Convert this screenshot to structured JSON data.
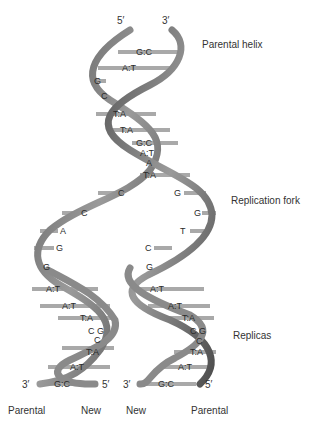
{
  "diagram": {
    "colors": {
      "ribbon": "#7a7a7a",
      "ribbon_dark": "#4a4a4a",
      "ribbon_light": "#b8b8b8",
      "bar": "#a8a8a8",
      "text": "#2a2a2a"
    }
  },
  "labels": {
    "parental_helix": "Parental helix",
    "replication_fork": "Replication fork",
    "replicas": "Replicas"
  },
  "strand_ends": {
    "top_5": "5′",
    "top_3": "3′",
    "left_3": "3′",
    "left_5": "5′",
    "right_3": "3′",
    "right_5": "5′"
  },
  "bottom_labels": {
    "left_parental": "Parental",
    "left_new": "New",
    "right_new": "New",
    "right_parental": "Parental"
  },
  "parental_helix_pairs": [
    "G:C",
    "A:T",
    "G",
    "C",
    "T:A",
    "T:A",
    "G:C",
    "A:T",
    "A",
    "T:A"
  ],
  "left_fork_bases": [
    "C",
    "C",
    "A",
    "G"
  ],
  "right_fork_bases": [
    "G",
    "G",
    "T",
    "C"
  ],
  "left_replica_pairs": [
    "G",
    "A:T",
    "A:T",
    "T:A",
    "C G",
    "C",
    "T:A",
    "A:T",
    "G:C"
  ],
  "right_replica_pairs": [
    "G",
    "A:T",
    "A:T",
    "T:A",
    "C G",
    "C",
    "T:A",
    "A:T",
    "G:C"
  ]
}
